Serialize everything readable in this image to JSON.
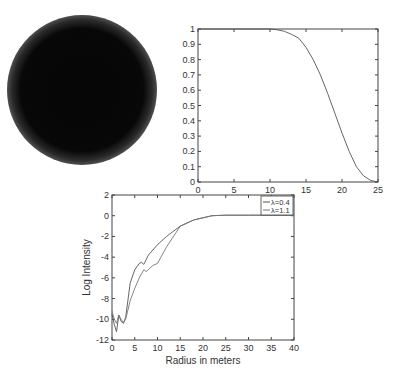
{
  "chart_data": [
    {
      "type": "image",
      "description": "Dark circular disc with soft blurred edge on white background",
      "title": "",
      "xlabel": "",
      "ylabel": ""
    },
    {
      "type": "line",
      "title": "",
      "xlabel": "",
      "ylabel": "",
      "xlim": [
        0,
        25
      ],
      "ylim": [
        0,
        1
      ],
      "x_ticks": [
        "0",
        "5",
        "10",
        "15",
        "20",
        "25"
      ],
      "y_ticks": [
        "0",
        "0.1",
        "0.2",
        "0.3",
        "0.4",
        "0.5",
        "0.6",
        "0.7",
        "0.8",
        "0.9",
        "1"
      ],
      "grid": false,
      "series": [
        {
          "name": "profile",
          "x": [
            0,
            5,
            10,
            11,
            12,
            13,
            14,
            15,
            16,
            17,
            18,
            19,
            20,
            21,
            22,
            23,
            24,
            25
          ],
          "y": [
            1,
            1,
            1,
            0.995,
            0.985,
            0.965,
            0.94,
            0.88,
            0.8,
            0.7,
            0.58,
            0.45,
            0.32,
            0.2,
            0.1,
            0.04,
            0.01,
            0.0
          ]
        }
      ]
    },
    {
      "type": "line",
      "title": "",
      "xlabel": "Radius in meters",
      "ylabel": "Log Intensity",
      "xlim": [
        0,
        40
      ],
      "ylim": [
        -12,
        2
      ],
      "x_ticks": [
        "0",
        "5",
        "10",
        "15",
        "20",
        "25",
        "30",
        "35",
        "40"
      ],
      "y_ticks": [
        "-12",
        "-10",
        "-8",
        "-6",
        "-4",
        "-2",
        "0",
        "2"
      ],
      "grid": false,
      "legend_position": "upper right",
      "series": [
        {
          "name": "λ=0.4",
          "x": [
            0,
            0.5,
            1,
            1.5,
            2,
            2.5,
            3,
            4,
            5,
            6,
            6.5,
            7,
            8,
            10,
            12,
            15,
            18,
            20,
            22,
            25,
            30,
            40
          ],
          "y": [
            -9.5,
            -10.5,
            -11.2,
            -9.6,
            -10.2,
            -10.4,
            -9.8,
            -6.5,
            -5.2,
            -4.6,
            -4.5,
            -4.7,
            -3.8,
            -2.8,
            -2.0,
            -1.0,
            -0.4,
            -0.2,
            0.0,
            0.05,
            0.05,
            0.05
          ]
        },
        {
          "name": "λ=1.1",
          "x": [
            0,
            0.5,
            1,
            1.5,
            2,
            2.5,
            3,
            4,
            5,
            6,
            7,
            7.5,
            8,
            9,
            10,
            12,
            15,
            18,
            20,
            22,
            25,
            30,
            40
          ],
          "y": [
            -9.2,
            -10.0,
            -10.4,
            -9.6,
            -10.0,
            -10.3,
            -10.0,
            -8.2,
            -7.0,
            -6.0,
            -5.2,
            -5.4,
            -5.2,
            -4.8,
            -4.6,
            -3.0,
            -1.0,
            -0.4,
            -0.2,
            0.0,
            0.05,
            0.05,
            0.05
          ]
        }
      ]
    }
  ]
}
